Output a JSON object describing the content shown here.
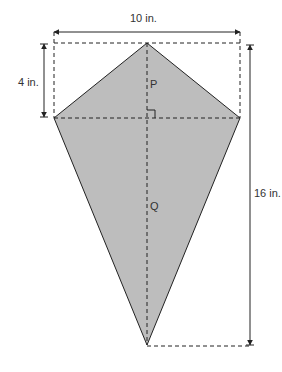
{
  "figure": {
    "type": "kite",
    "fill_color": "#bdbdbd",
    "stroke_color": "#222222",
    "labels": {
      "width": "10 in.",
      "top_height": "4 in.",
      "total_height": "16 in.",
      "point_p": "P",
      "point_q": "Q"
    },
    "dimensions": {
      "horizontal_diagonal_in": 10,
      "top_segment_in": 4,
      "vertical_diagonal_in": 16
    }
  }
}
